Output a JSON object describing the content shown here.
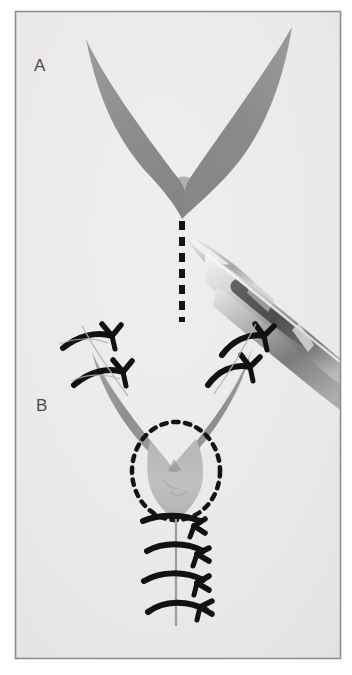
{
  "figure": {
    "background_color": "#ffffff",
    "plate_color": "#edebe9",
    "frame_border_color": "#8e8e8e",
    "width": 352,
    "height": 675
  },
  "panels": [
    {
      "id": "panel-a",
      "label": "A",
      "label_x": 40,
      "label_y": 71,
      "caption": "V-shaped skin flap outlined with scalpel; dashed line marks the planned midline incision",
      "elements": [
        "v-flap-wings",
        "dashed-incision-line",
        "scalpel"
      ]
    },
    {
      "id": "panel-b",
      "label": "B",
      "label_x": 42,
      "label_y": 411,
      "caption": "Flap advanced and closed in Y configuration with interrupted sutures; dotted circle marks the advanced flap tip",
      "elements": [
        "v-flap-advanced",
        "dotted-circle-marker",
        "suture-line-vertical",
        "sutures-left",
        "sutures-right"
      ]
    }
  ],
  "graphics": {
    "flap_fill_dark": "#8b8b8b",
    "flap_fill_mid": "#9a9a9a",
    "flap_fill_light": "#b4b4b4",
    "flap_fill_pale": "#c2c2c2",
    "suture_color": "#111111",
    "dash_color": "#141414",
    "thread_color": "#9b9b9b",
    "scalpel_light": "#e2e2e2",
    "scalpel_mid": "#b8b8b8",
    "scalpel_dark": "#6e6e6e",
    "scalpel_shadow": "#4f4f4f"
  },
  "annotations": {
    "dashed_line": {
      "name": "incision-line",
      "x": 182,
      "y_start": 220,
      "y_end": 322,
      "dash_pattern": "9 7",
      "stroke_width": 6
    },
    "dotted_circle": {
      "name": "flap-tip-marker",
      "cx": 176,
      "cy": 471,
      "rx": 44,
      "ry": 49,
      "dash_pattern": "5 6",
      "stroke_width": 4
    },
    "suture_counts": {
      "left_wing": 2,
      "right_wing": 2,
      "midline": 4
    }
  }
}
